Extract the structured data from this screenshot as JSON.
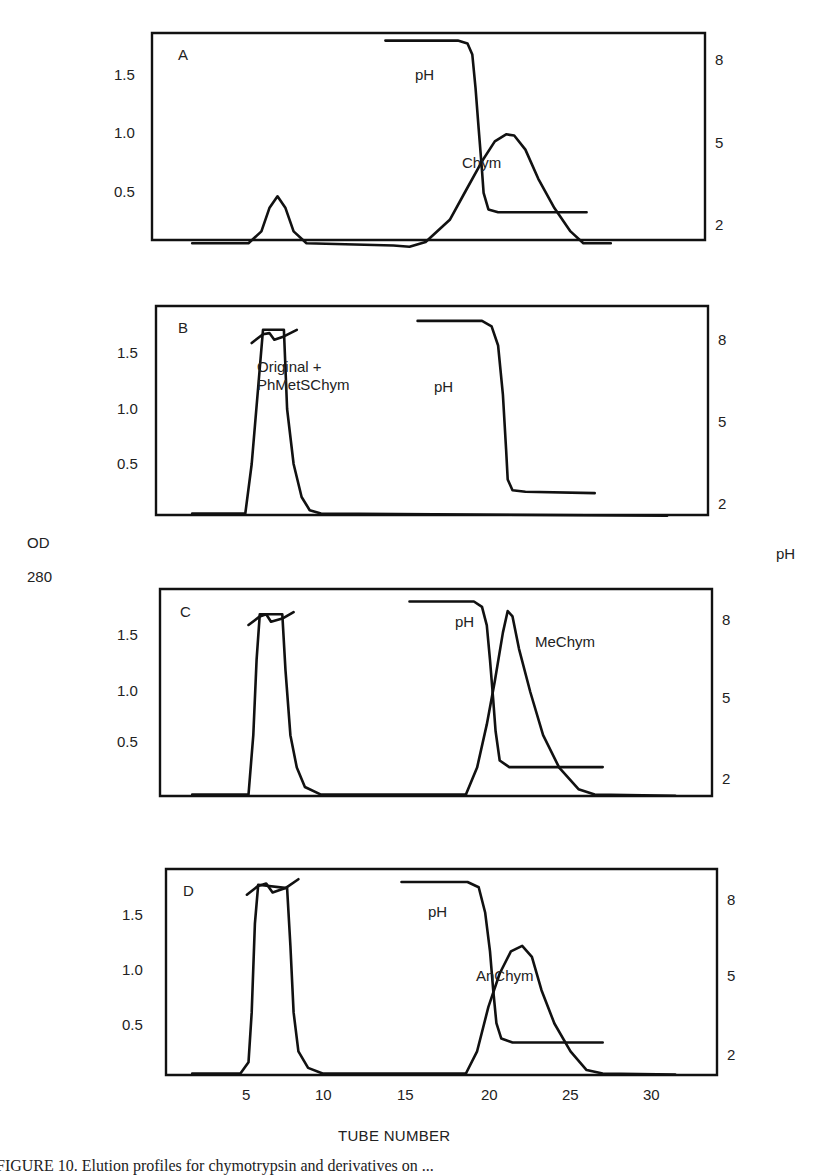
{
  "figure": {
    "left_axis_label_line1": "OD",
    "left_axis_label_line2": "280",
    "right_axis_label": "pH",
    "x_axis_title": "TUBE NUMBER",
    "caption": "FIGURE 10. Elution profiles for chymotrypsin and derivatives on ..."
  },
  "chart_data": [
    {
      "type": "line",
      "panel": "A",
      "title": "A",
      "xlabel": "TUBE NUMBER",
      "ylabel": "OD 280",
      "ylabel_right": "pH",
      "x_ticks": [
        5,
        10,
        15,
        20,
        25,
        30
      ],
      "y_ticks_left": [
        "0.5",
        "1.0",
        "1.5"
      ],
      "y_ticks_right": [
        "2",
        "5",
        "8"
      ],
      "xlim": [
        0,
        34
      ],
      "ylim": [
        0,
        1.8
      ],
      "ylim_right": [
        1.5,
        9
      ],
      "grid": false,
      "series": [
        {
          "name": "OD 280",
          "axis": "left",
          "points": [
            [
              1.5,
              0.05
            ],
            [
              5,
              0.05
            ],
            [
              5.8,
              0.15
            ],
            [
              6.3,
              0.35
            ],
            [
              6.8,
              0.45
            ],
            [
              7.3,
              0.35
            ],
            [
              7.8,
              0.15
            ],
            [
              8.6,
              0.05
            ],
            [
              14,
              0.03
            ],
            [
              15,
              0.02
            ],
            [
              16,
              0.06
            ],
            [
              17.5,
              0.25
            ],
            [
              18.5,
              0.5
            ],
            [
              19.5,
              0.75
            ],
            [
              20.3,
              0.92
            ],
            [
              21,
              0.98
            ],
            [
              21.5,
              0.97
            ],
            [
              22.2,
              0.85
            ],
            [
              23,
              0.6
            ],
            [
              24,
              0.35
            ],
            [
              25,
              0.15
            ],
            [
              25.8,
              0.05
            ],
            [
              27.5,
              0.05
            ]
          ]
        },
        {
          "name": "pH",
          "axis": "right",
          "label": "pH",
          "points": [
            [
              13.5,
              8.7
            ],
            [
              18,
              8.7
            ],
            [
              18.6,
              8.6
            ],
            [
              18.9,
              8.2
            ],
            [
              19.1,
              7
            ],
            [
              19.3,
              5.5
            ],
            [
              19.5,
              4
            ],
            [
              19.6,
              3.2
            ],
            [
              19.9,
              2.6
            ],
            [
              20.5,
              2.5
            ],
            [
              26,
              2.5
            ]
          ]
        },
        {
          "name": "Chym",
          "label": "Chym",
          "axis": "none"
        }
      ]
    },
    {
      "type": "line",
      "panel": "B",
      "title": "B",
      "xlabel": "TUBE NUMBER",
      "ylabel": "OD 280",
      "ylabel_right": "pH",
      "x_ticks": [
        5,
        10,
        15,
        20,
        25,
        30
      ],
      "y_ticks_left": [
        "0.5",
        "1.0",
        "1.5"
      ],
      "y_ticks_right": [
        "2",
        "5",
        "8"
      ],
      "xlim": [
        0,
        34
      ],
      "ylim": [
        0,
        1.8
      ],
      "ylim_right": [
        1.5,
        9
      ],
      "grid": false,
      "series": [
        {
          "name": "OD 280",
          "axis": "left",
          "label": "Original + PhMetSChym",
          "points": [
            [
              1.5,
              0.05
            ],
            [
              4.8,
              0.05
            ],
            [
              5.2,
              0.5
            ],
            [
              5.6,
              1.2
            ],
            [
              5.9,
              1.72
            ],
            [
              7.2,
              1.72
            ],
            [
              7.4,
              1.0
            ],
            [
              7.8,
              0.5
            ],
            [
              8.3,
              0.2
            ],
            [
              8.8,
              0.08
            ],
            [
              9.5,
              0.05
            ],
            [
              31,
              0.03
            ]
          ]
        },
        {
          "name": "OD 280 off-scale cap",
          "axis": "left",
          "points": [
            [
              5.2,
              1.6
            ],
            [
              5.9,
              1.68
            ],
            [
              6.3,
              1.69
            ],
            [
              6.6,
              1.63
            ],
            [
              7.2,
              1.66
            ],
            [
              8,
              1.72
            ]
          ]
        },
        {
          "name": "pH",
          "axis": "right",
          "label": "pH",
          "points": [
            [
              15.5,
              8.7
            ],
            [
              19.5,
              8.7
            ],
            [
              20.1,
              8.5
            ],
            [
              20.5,
              7.8
            ],
            [
              20.8,
              6
            ],
            [
              21,
              4
            ],
            [
              21.1,
              2.9
            ],
            [
              21.4,
              2.5
            ],
            [
              22.2,
              2.45
            ],
            [
              26.5,
              2.4
            ]
          ]
        }
      ]
    },
    {
      "type": "line",
      "panel": "C",
      "title": "C",
      "xlabel": "TUBE NUMBER",
      "ylabel": "OD 280",
      "ylabel_right": "pH",
      "x_ticks": [
        5,
        10,
        15,
        20,
        25,
        30
      ],
      "y_ticks_left": [
        "0.5",
        "1.0",
        "1.5"
      ],
      "y_ticks_right": [
        "2",
        "5",
        "8"
      ],
      "xlim": [
        0,
        34
      ],
      "ylim": [
        0,
        1.8
      ],
      "ylim_right": [
        1.5,
        9
      ],
      "grid": false,
      "series": [
        {
          "name": "OD 280 (first peak)",
          "axis": "left",
          "points": [
            [
              1.5,
              0.05
            ],
            [
              5,
              0.05
            ],
            [
              5.3,
              0.6
            ],
            [
              5.5,
              1.3
            ],
            [
              5.7,
              1.72
            ],
            [
              7.1,
              1.72
            ],
            [
              7.3,
              1.2
            ],
            [
              7.6,
              0.6
            ],
            [
              8,
              0.3
            ],
            [
              8.5,
              0.12
            ],
            [
              9.5,
              0.05
            ],
            [
              18.5,
              0.05
            ]
          ]
        },
        {
          "name": "OD 280 off-scale cap",
          "axis": "left",
          "points": [
            [
              5,
              1.62
            ],
            [
              5.7,
              1.7
            ],
            [
              6.1,
              1.72
            ],
            [
              6.4,
              1.65
            ],
            [
              7.1,
              1.68
            ],
            [
              7.8,
              1.74
            ]
          ]
        },
        {
          "name": "MeChym",
          "axis": "left",
          "label": "MeChym",
          "points": [
            [
              18.5,
              0.05
            ],
            [
              19.2,
              0.3
            ],
            [
              19.8,
              0.7
            ],
            [
              20.3,
              1.1
            ],
            [
              20.8,
              1.55
            ],
            [
              21.1,
              1.75
            ],
            [
              21.4,
              1.7
            ],
            [
              21.8,
              1.4
            ],
            [
              22.5,
              1.0
            ],
            [
              23.3,
              0.6
            ],
            [
              24.3,
              0.3
            ],
            [
              25.5,
              0.1
            ],
            [
              26.5,
              0.05
            ],
            [
              31.5,
              0.04
            ]
          ]
        },
        {
          "name": "pH",
          "axis": "right",
          "label": "pH",
          "points": [
            [
              15,
              8.7
            ],
            [
              19,
              8.7
            ],
            [
              19.5,
              8.5
            ],
            [
              19.8,
              7.8
            ],
            [
              20,
              6.5
            ],
            [
              20.2,
              5
            ],
            [
              20.35,
              3.8
            ],
            [
              20.6,
              2.7
            ],
            [
              21.2,
              2.45
            ],
            [
              27,
              2.45
            ]
          ]
        }
      ]
    },
    {
      "type": "line",
      "panel": "D",
      "title": "D",
      "xlabel": "TUBE NUMBER",
      "ylabel": "OD 280",
      "ylabel_right": "pH",
      "x_ticks": [
        5,
        10,
        15,
        20,
        25,
        30
      ],
      "y_ticks_left": [
        "0.5",
        "1.0",
        "1.5"
      ],
      "y_ticks_right": [
        "2",
        "5",
        "8"
      ],
      "xlim": [
        0,
        34
      ],
      "ylim": [
        0,
        1.8
      ],
      "ylim_right": [
        1.5,
        9
      ],
      "grid": false,
      "series": [
        {
          "name": "OD 280 (first peak)",
          "axis": "left",
          "points": [
            [
              1.5,
              0.05
            ],
            [
              4.5,
              0.05
            ],
            [
              5,
              0.15
            ],
            [
              5.2,
              0.6
            ],
            [
              5.4,
              1.4
            ],
            [
              5.6,
              1.75
            ],
            [
              7.4,
              1.72
            ],
            [
              7.6,
              1.2
            ],
            [
              7.8,
              0.6
            ],
            [
              8.1,
              0.25
            ],
            [
              8.7,
              0.1
            ],
            [
              9.6,
              0.05
            ],
            [
              18.5,
              0.05
            ]
          ]
        },
        {
          "name": "OD 280 off-scale cap",
          "axis": "left",
          "points": [
            [
              4.9,
              1.66
            ],
            [
              5.6,
              1.74
            ],
            [
              6.1,
              1.76
            ],
            [
              6.5,
              1.68
            ],
            [
              7.3,
              1.72
            ],
            [
              8.1,
              1.8
            ]
          ]
        },
        {
          "name": "AnChym",
          "axis": "left",
          "label": "AnChym",
          "points": [
            [
              18.5,
              0.05
            ],
            [
              19.2,
              0.25
            ],
            [
              19.9,
              0.65
            ],
            [
              20.6,
              0.95
            ],
            [
              21.3,
              1.15
            ],
            [
              22,
              1.2
            ],
            [
              22.6,
              1.1
            ],
            [
              23.2,
              0.8
            ],
            [
              24,
              0.5
            ],
            [
              25,
              0.25
            ],
            [
              26,
              0.08
            ],
            [
              27,
              0.05
            ],
            [
              31.5,
              0.04
            ]
          ]
        },
        {
          "name": "pH",
          "axis": "right",
          "label": "pH",
          "points": [
            [
              14.5,
              8.7
            ],
            [
              18.6,
              8.7
            ],
            [
              19.3,
              8.5
            ],
            [
              19.7,
              7.5
            ],
            [
              20,
              6
            ],
            [
              20.2,
              4.5
            ],
            [
              20.4,
              3.2
            ],
            [
              20.7,
              2.6
            ],
            [
              21.4,
              2.45
            ],
            [
              27,
              2.45
            ]
          ]
        }
      ]
    }
  ]
}
